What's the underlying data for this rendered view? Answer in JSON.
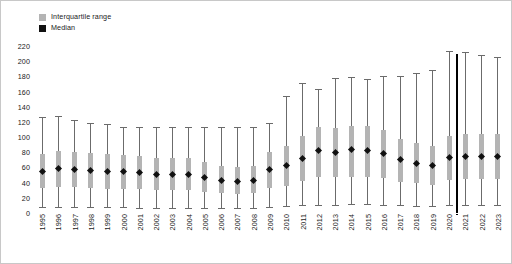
{
  "legend": {
    "position": "top-left",
    "items": [
      {
        "label": "Interquartile range",
        "color": "#b4b4b4",
        "name": "iqr"
      },
      {
        "label": "Median",
        "color": "#111111",
        "name": "median"
      }
    ]
  },
  "colors": {
    "iqr": "#b4b4b4",
    "median": "#111111",
    "whisker": "#6b6b6b",
    "divider": "#000000",
    "text": "#1a1a1a",
    "background": "#ffffff"
  },
  "annotations": [
    {
      "type": "vertical-line",
      "after_category": "2020",
      "color": "#000000"
    }
  ],
  "chart_data": {
    "type": "box",
    "title": "",
    "xlabel": "",
    "ylabel": "",
    "ylim": [
      0,
      220
    ],
    "yticks": [
      0,
      20,
      40,
      60,
      80,
      100,
      120,
      140,
      160,
      180,
      200,
      220
    ],
    "ytick_labels": [
      "0",
      "20",
      "40",
      "60",
      "80",
      "100",
      "120",
      "140",
      "160",
      "180",
      "200",
      "220"
    ],
    "grid": false,
    "legend_position": "top-left",
    "categories": [
      "1995",
      "1996",
      "1997",
      "1998",
      "1999",
      "2000",
      "2001",
      "2002",
      "2003",
      "2004",
      "2005",
      "2006",
      "2007",
      "2008",
      "2009",
      "2010",
      "2011",
      "2012",
      "2013",
      "2014",
      "2015",
      "2016",
      "2017",
      "2018",
      "2019",
      "2020",
      "2021",
      "2022",
      "2023"
    ],
    "series": [
      {
        "name": "Median",
        "values": [
          55,
          58,
          57,
          56,
          55,
          55,
          53,
          51,
          51,
          51,
          47,
          43,
          42,
          43,
          57,
          62,
          72,
          82,
          80,
          83,
          82,
          78,
          70,
          65,
          62,
          73,
          74,
          74,
          74
        ]
      },
      {
        "name": "Q1",
        "values": [
          33,
          34,
          34,
          33,
          32,
          32,
          31,
          30,
          30,
          30,
          28,
          26,
          25,
          26,
          33,
          36,
          42,
          47,
          47,
          48,
          48,
          46,
          41,
          39,
          37,
          44,
          45,
          45,
          45
        ]
      },
      {
        "name": "Q3",
        "values": [
          78,
          82,
          80,
          79,
          78,
          77,
          75,
          72,
          72,
          72,
          67,
          62,
          60,
          62,
          80,
          88,
          101,
          113,
          112,
          115,
          114,
          109,
          98,
          92,
          88,
          102,
          104,
          104,
          104
        ]
      },
      {
        "name": "Whisker low",
        "values": [
          8,
          8,
          8,
          8,
          8,
          8,
          7,
          7,
          7,
          7,
          7,
          6,
          6,
          6,
          8,
          9,
          10,
          11,
          11,
          12,
          12,
          11,
          10,
          9,
          9,
          10,
          11,
          11,
          11
        ]
      },
      {
        "name": "Whisker high",
        "values": [
          127,
          128,
          123,
          119,
          117,
          113,
          113,
          113,
          113,
          113,
          113,
          113,
          113,
          113,
          119,
          154,
          171,
          163,
          178,
          179,
          176,
          181,
          180,
          185,
          188,
          213,
          212,
          208,
          205
        ]
      }
    ]
  }
}
